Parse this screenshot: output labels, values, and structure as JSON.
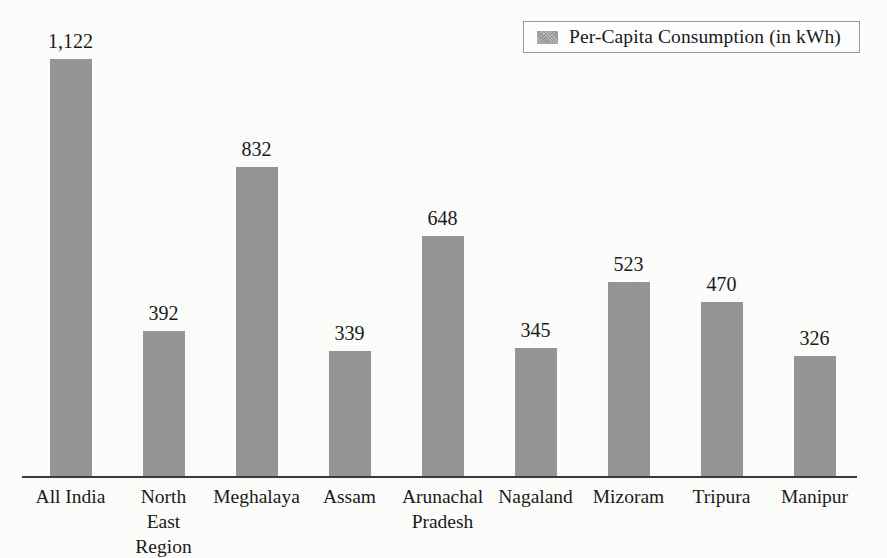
{
  "chart_data": {
    "type": "bar",
    "title": "",
    "subtitle": "",
    "xlabel": "",
    "ylabel": "",
    "ylim": [
      0,
      1122
    ],
    "grid": false,
    "legend_position": "top-right",
    "value_labels": true,
    "bar_color": "#969696",
    "axis_color": "#3a3a3a",
    "categories": [
      "All India",
      "North East Region",
      "Meghalaya",
      "Assam",
      "Arunachal Pradesh",
      "Nagaland",
      "Mizoram",
      "Tripura",
      "Manipur"
    ],
    "values": [
      1122,
      392,
      832,
      339,
      648,
      345,
      523,
      470,
      326
    ],
    "series": [
      {
        "name": "Per-Capita Consumption (in kWh)",
        "values": [
          1122,
          392,
          832,
          339,
          648,
          345,
          523,
          470,
          326
        ]
      }
    ]
  },
  "legend": {
    "label": "Per-Capita Consumption (in kWh)",
    "swatch_color": "#9a9a9a"
  },
  "bars": [
    {
      "category_line1": "All India",
      "category_line2": "",
      "value_label": "1,122",
      "value": 1122
    },
    {
      "category_line1": "North",
      "category_line2": "East Region",
      "value_label": "392",
      "value": 392
    },
    {
      "category_line1": "Meghalaya",
      "category_line2": "",
      "value_label": "832",
      "value": 832
    },
    {
      "category_line1": "Assam",
      "category_line2": "",
      "value_label": "339",
      "value": 339
    },
    {
      "category_line1": "Arunachal",
      "category_line2": "Pradesh",
      "value_label": "648",
      "value": 648
    },
    {
      "category_line1": "Nagaland",
      "category_line2": "",
      "value_label": "345",
      "value": 345
    },
    {
      "category_line1": "Mizoram",
      "category_line2": "",
      "value_label": "523",
      "value": 523
    },
    {
      "category_line1": "Tripura",
      "category_line2": "",
      "value_label": "470",
      "value": 470
    },
    {
      "category_line1": "Manipur",
      "category_line2": "",
      "value_label": "326",
      "value": 326
    }
  ]
}
